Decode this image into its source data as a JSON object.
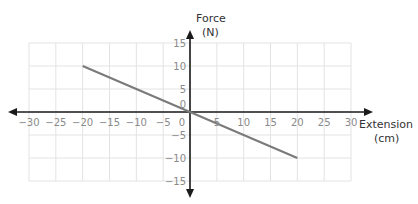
{
  "chart_data": {
    "type": "line",
    "title": "",
    "xlabel": "Extension (cm)",
    "ylabel": "Force (N)",
    "xlabel_lines": [
      "Extension",
      "(cm)"
    ],
    "ylabel_lines": [
      "Force",
      "(N)"
    ],
    "xlim": [
      -30,
      30
    ],
    "ylim": [
      -15,
      15
    ],
    "x_ticks": [
      -30,
      -25,
      -20,
      -15,
      -10,
      -5,
      0,
      5,
      10,
      15,
      20,
      25,
      30
    ],
    "y_ticks": [
      -15,
      -10,
      -5,
      0,
      5,
      10,
      15
    ],
    "grid": true,
    "legend": null,
    "series": [
      {
        "name": "Force vs Extension",
        "x": [
          -20,
          20
        ],
        "y": [
          10,
          -10
        ],
        "color": "#7a7a7a"
      }
    ]
  },
  "colors": {
    "grid": "#e3e3e3",
    "axis": "#1a1a1a",
    "tick_text": "#8a8a8a",
    "label_text": "#333333",
    "line": "#7a7a7a"
  }
}
